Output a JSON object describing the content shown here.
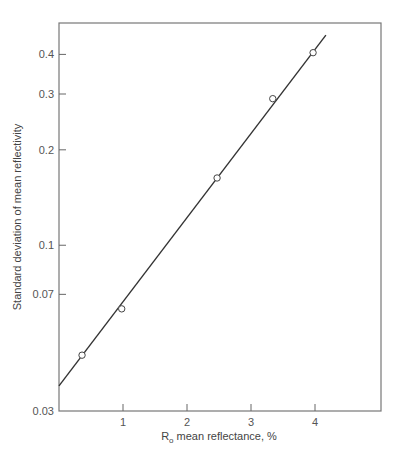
{
  "chart_data": {
    "type": "scatter",
    "title": "",
    "xlabel": "R0 mean reflectance, %",
    "xlabel_parts": {
      "main": "R",
      "subscript": "o",
      "rest": " mean reflectance, %"
    },
    "ylabel": "Standard deviation of mean reflectivity",
    "xscale": "linear",
    "yscale": "log",
    "xlim": [
      0,
      5.05
    ],
    "ylim": [
      0.03,
      0.46
    ],
    "xticks": [
      1,
      2,
      3,
      4
    ],
    "xtick_labels": [
      "1",
      "2",
      "3",
      "4"
    ],
    "yticks": [
      0.03,
      0.07,
      0.1,
      0.2,
      0.3,
      0.4
    ],
    "ytick_labels": [
      "0.03",
      "0.07",
      "0.1",
      "0.2",
      "0.3",
      "0.4"
    ],
    "grid": false,
    "legend": null,
    "series": [
      {
        "name": "measured",
        "marker": "open-circle",
        "x": [
          0.36,
          0.98,
          2.47,
          3.34,
          3.97
        ],
        "y": [
          0.045,
          0.063,
          0.163,
          0.29,
          0.405
        ]
      },
      {
        "name": "fit line",
        "style": "line",
        "x": [
          0.0,
          4.17
        ],
        "y": [
          0.036,
          0.46
        ]
      }
    ],
    "colors": {
      "axis": "#666666",
      "line": "#333333",
      "marker_edge": "#444444",
      "marker_fill": "#ffffff"
    }
  }
}
